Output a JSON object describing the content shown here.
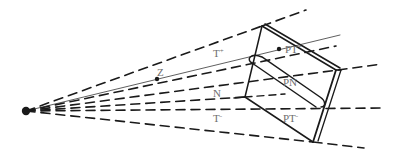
{
  "diagram": {
    "type": "perspective-cone-projection",
    "colors": {
      "ink": "#1a1a1a",
      "label": "#6e6e6e",
      "background": "#ffffff"
    },
    "apex": {
      "x": 26,
      "y": 111
    },
    "labels": {
      "z": {
        "text": "Z",
        "x": 158,
        "y": 65
      },
      "t_plus": {
        "base": "T",
        "sup": "+",
        "x": 218,
        "y": 53
      },
      "pt_plus": {
        "base": "PT",
        "sup": "+",
        "x": 285,
        "y": 47
      },
      "pn": {
        "base": "PN",
        "sup": "",
        "x": 283,
        "y": 82
      },
      "n": {
        "base": "N",
        "sup": "",
        "x": 213,
        "y": 90
      },
      "t_minus": {
        "base": "T",
        "sup": "-",
        "x": 213,
        "y": 116
      },
      "pt_minus": {
        "base": "PT",
        "sup": "-",
        "x": 283,
        "y": 116
      }
    },
    "points": {
      "z_point": {
        "x": 157,
        "y": 79
      },
      "pt_plus_point": {
        "x": 279,
        "y": 49
      }
    }
  }
}
